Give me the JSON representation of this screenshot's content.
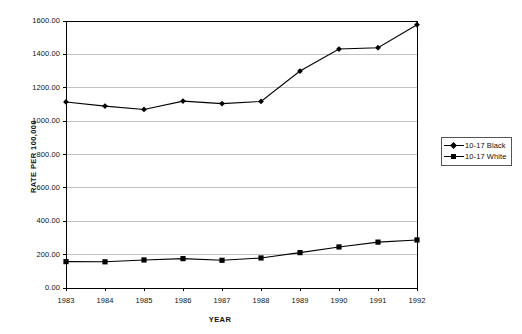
{
  "chart_data": {
    "type": "line",
    "title": "",
    "subtitle": "",
    "xlabel": "YEAR",
    "ylabel": "RATE PER 100,000",
    "categories": [
      "1983",
      "1984",
      "1985",
      "1986",
      "1987",
      "1988",
      "1989",
      "1990",
      "1991",
      "1992"
    ],
    "x": [
      1983,
      1984,
      1985,
      1986,
      1987,
      1988,
      1989,
      1990,
      1991,
      1992
    ],
    "series": [
      {
        "name": "10-17 Black",
        "marker": "diamond",
        "color": "#000000",
        "values": [
          1115,
          1090,
          1070,
          1120,
          1105,
          1118,
          1300,
          1432,
          1440,
          1578
        ]
      },
      {
        "name": "10-17 White",
        "marker": "square",
        "color": "#000000",
        "values": [
          158,
          157,
          168,
          176,
          166,
          180,
          212,
          246,
          275,
          288
        ]
      }
    ],
    "ylim": [
      0,
      1600
    ],
    "ytick_step": 200,
    "ytick_labels": [
      "0.00",
      "200.00",
      "400.00",
      "600.00",
      "800.00",
      "1000.00",
      "1200.00",
      "1400.00",
      "1600.00"
    ],
    "ytick_values": [
      0,
      200,
      400,
      600,
      800,
      1000,
      1200,
      1400,
      1600
    ],
    "xtick_labels": [
      "1983",
      "1984",
      "1985",
      "1986",
      "1987",
      "1988",
      "1989",
      "1990",
      "1991",
      "1992"
    ],
    "grid": "horizontal",
    "grid_color": "#999999",
    "legend_position": "right",
    "legend_entries": [
      "10-17 Black",
      "10-17 White"
    ],
    "axis_color": "#000000",
    "background": "#ffffff"
  }
}
